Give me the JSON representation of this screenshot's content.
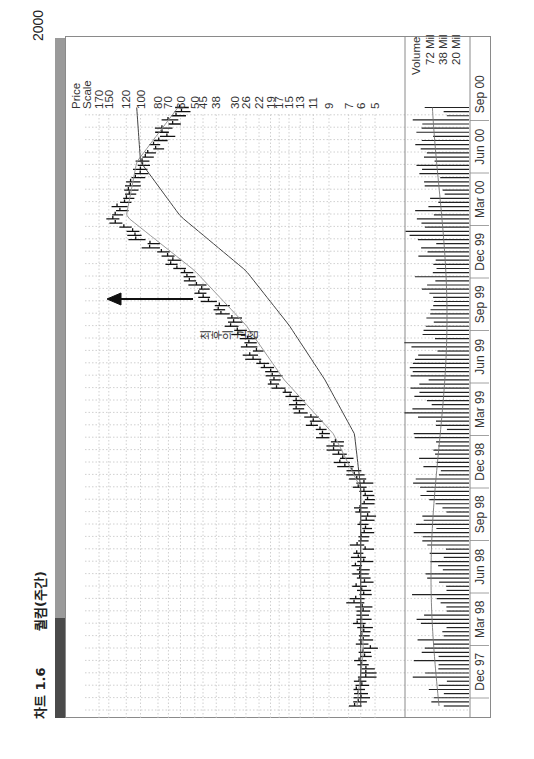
{
  "header": {
    "figure_number": "차트 1.6",
    "title": "퀄컴(주간)",
    "year_label": "2000"
  },
  "price_scale": {
    "title_line1": "Price",
    "title_line2": "Scale",
    "ticks": [
      "170",
      "150",
      "120",
      "100",
      "80",
      "70",
      "60",
      "50",
      "45",
      "38",
      "30",
      "26",
      "22",
      "19",
      "17",
      "15",
      "13",
      "11",
      "9",
      "7",
      "6",
      "5"
    ]
  },
  "volume_scale": {
    "title": "Volume",
    "ticks": [
      "72 Mil",
      "38 Mil",
      "20 Mil"
    ]
  },
  "x_axis": {
    "labels": [
      "Dec 97",
      "Mar 98",
      "Jun 98",
      "Sep 98",
      "Dec 98",
      "Mar 99",
      "Jun 99",
      "Sep 99",
      "Dec 99",
      "Mar 00",
      "Jun 00",
      "Sep 00"
    ]
  },
  "annotation": {
    "text": "최후의 고점"
  },
  "colors": {
    "band_dark": "#4a4a4a",
    "band_light": "#9a9a9a",
    "bars": "#1a1a1a",
    "ma_short": "#8a8a8a",
    "ma_long": "#444444",
    "grid": "#bbbbbb"
  },
  "chart_data": {
    "type": "line",
    "title": "퀄컴(주간)",
    "xlabel": "",
    "ylabel": "Price Scale",
    "scale": "log",
    "ylim": [
      5,
      170
    ],
    "grid": true,
    "x": [
      "Dec 97",
      "Mar 98",
      "Jun 98",
      "Sep 98",
      "Dec 98",
      "Mar 99",
      "Jun 99",
      "Sep 99",
      "Dec 99",
      "Mar 00",
      "Jun 00",
      "Sep 00"
    ],
    "series": [
      {
        "name": "Weekly price (approx. close)",
        "values": [
          6.5,
          5.6,
          6.2,
          6.0,
          5.8,
          9.5,
          19,
          30,
          60,
          145,
          95,
          60
        ]
      },
      {
        "name": "Short moving average",
        "values": [
          6.3,
          5.8,
          6.0,
          6.0,
          6.0,
          8.5,
          16,
          26,
          50,
          120,
          105,
          62
        ]
      },
      {
        "name": "Long moving average",
        "values": [
          6.0,
          6.0,
          6.0,
          6.0,
          6.0,
          6.5,
          9.5,
          15,
          26,
          60,
          100,
          105
        ]
      }
    ],
    "volume": {
      "ylabel": "Volume",
      "ticks": [
        "72 Mil",
        "38 Mil",
        "20 Mil"
      ]
    },
    "annotations": [
      {
        "text": "최후의 고점",
        "x": "Jan 00",
        "note": "arrow pointing to final peak (~170)"
      }
    ]
  }
}
